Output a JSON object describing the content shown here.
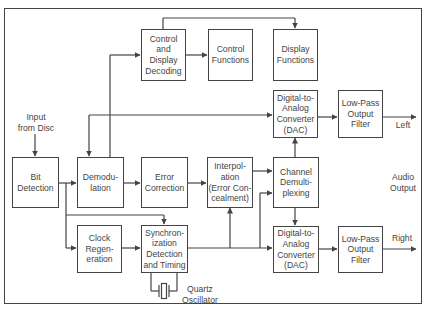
{
  "diagram": {
    "blocks": [
      {
        "id": "control-display-decoding",
        "label": "Control\nand\nDisplay\nDecoding"
      },
      {
        "id": "control-functions",
        "label": "Control\nFunctions"
      },
      {
        "id": "display-functions",
        "label": "Display\nFunctions"
      },
      {
        "id": "dac-left",
        "label": "Digital-to-\nAnalog\nConverter\n(DAC)"
      },
      {
        "id": "lpf-left",
        "label": "Low-Pass\nOutput\nFilter"
      },
      {
        "id": "bit-detection",
        "label": "Bit\nDetection"
      },
      {
        "id": "demodulation",
        "label": "Demodu-\nlation"
      },
      {
        "id": "error-correction",
        "label": "Error\nCorrection"
      },
      {
        "id": "interpolation",
        "label": "Interpol-\nation\n(Error Con-\ncealment)"
      },
      {
        "id": "channel-demux",
        "label": "Channel\nDemulti-\nplexing"
      },
      {
        "id": "clock-regeneration",
        "label": "Clock\nRegen-\neration"
      },
      {
        "id": "sync-detection",
        "label": "Synchron-\nization\nDetection\nand Timing"
      },
      {
        "id": "dac-right",
        "label": "Digital-to-\nAnalog\nConverter\n(DAC)"
      },
      {
        "id": "lpf-right",
        "label": "Low-Pass\nOutput\nFilter"
      }
    ],
    "labels": {
      "input": "Input\nfrom Disc",
      "left": "Left",
      "right": "Right",
      "audio_output": "Audio\nOutput",
      "quartz": "Quartz\nOscillator"
    },
    "connections": [
      [
        "input",
        "bit-detection"
      ],
      [
        "bit-detection",
        "demodulation"
      ],
      [
        "bit-detection",
        "clock-regeneration"
      ],
      [
        "bit-detection",
        "sync-detection"
      ],
      [
        "demodulation",
        "error-correction"
      ],
      [
        "demodulation",
        "control-display-decoding"
      ],
      [
        "control-display-decoding",
        "control-functions"
      ],
      [
        "control-display-decoding",
        "display-functions"
      ],
      [
        "error-correction",
        "interpolation"
      ],
      [
        "interpolation",
        "channel-demux"
      ],
      [
        "clock-regeneration",
        "sync-detection"
      ],
      [
        "sync-detection",
        "demodulation"
      ],
      [
        "sync-detection",
        "dac-left"
      ],
      [
        "sync-detection",
        "interpolation"
      ],
      [
        "sync-detection",
        "channel-demux"
      ],
      [
        "sync-detection",
        "dac-right"
      ],
      [
        "channel-demux",
        "dac-left"
      ],
      [
        "channel-demux",
        "dac-right"
      ],
      [
        "dac-left",
        "lpf-left"
      ],
      [
        "dac-right",
        "lpf-right"
      ],
      [
        "quartz",
        "sync-detection"
      ]
    ]
  }
}
